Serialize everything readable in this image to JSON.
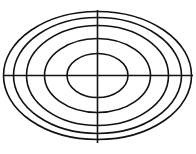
{
  "diagram": {
    "title": "",
    "stroke_color": "#111111",
    "background": "#ffffff",
    "stroke_width": 1.6,
    "center": {
      "cx": 97.5,
      "cy": 75.5
    },
    "ellipses": [
      {
        "rx": 30.5,
        "ry": 22
      },
      {
        "rx": 53,
        "ry": 37
      },
      {
        "rx": 71,
        "ry": 50
      },
      {
        "rx": 84,
        "ry": 58
      },
      {
        "rx": 94,
        "ry": 64
      }
    ],
    "axes": {
      "horizontal": {
        "x1": 3,
        "x2": 193,
        "y": 75.5
      },
      "vertical": {
        "x": 97.5,
        "y1": 10,
        "y2": 143
      }
    }
  }
}
